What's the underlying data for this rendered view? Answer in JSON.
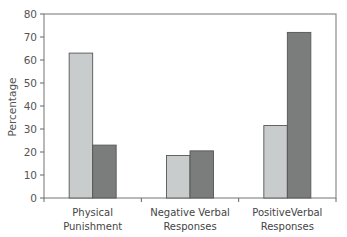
{
  "chart_data": {
    "type": "bar",
    "title": "",
    "xlabel": "",
    "ylabel": "Percentage",
    "ylim": [
      0,
      80
    ],
    "yticks": [
      0,
      10,
      20,
      30,
      40,
      50,
      60,
      70,
      80
    ],
    "grid": false,
    "legend": null,
    "categories": [
      [
        "Physical",
        "Punishment"
      ],
      [
        "Negative Verbal",
        "Responses"
      ],
      [
        "PositiveVerbal",
        "Responses"
      ]
    ],
    "series": [
      {
        "name": "Series 1 (light)",
        "color": "#c9cccc",
        "values": [
          63,
          18.5,
          31.5
        ]
      },
      {
        "name": "Series 2 (dark)",
        "color": "#7b7d7d",
        "values": [
          23,
          20.5,
          72
        ]
      }
    ]
  }
}
